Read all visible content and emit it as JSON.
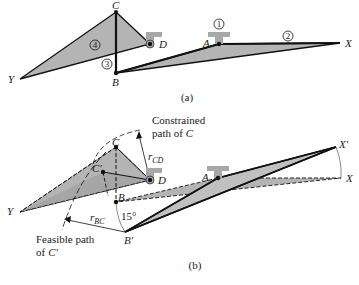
{
  "panel_a": {
    "caption": "(a)",
    "points": {
      "A": "A",
      "B": "B",
      "C": "C",
      "D": "D",
      "X": "X",
      "Y": "Y"
    },
    "link_numbers": [
      "1",
      "2",
      "3",
      "4"
    ]
  },
  "panel_b": {
    "caption": "(b)",
    "points": {
      "A": "A",
      "B": "B",
      "B_prime": "B′",
      "C": "C",
      "C_prime": "C′",
      "D": "D",
      "X": "X",
      "X_prime": "X′",
      "Y": "Y"
    },
    "angle_label": "15°",
    "r_cd": {
      "r": "r",
      "sub": "CD"
    },
    "r_bc": {
      "r": "r",
      "sub": "BC"
    },
    "constrained_path": [
      "Constrained",
      "path of",
      "C"
    ],
    "feasible_path": [
      "Feasible path",
      "of",
      "C′"
    ]
  },
  "colors": {
    "link_fill": "#b4b4b4",
    "line": "#111111",
    "ground": "#a8a8a8"
  }
}
